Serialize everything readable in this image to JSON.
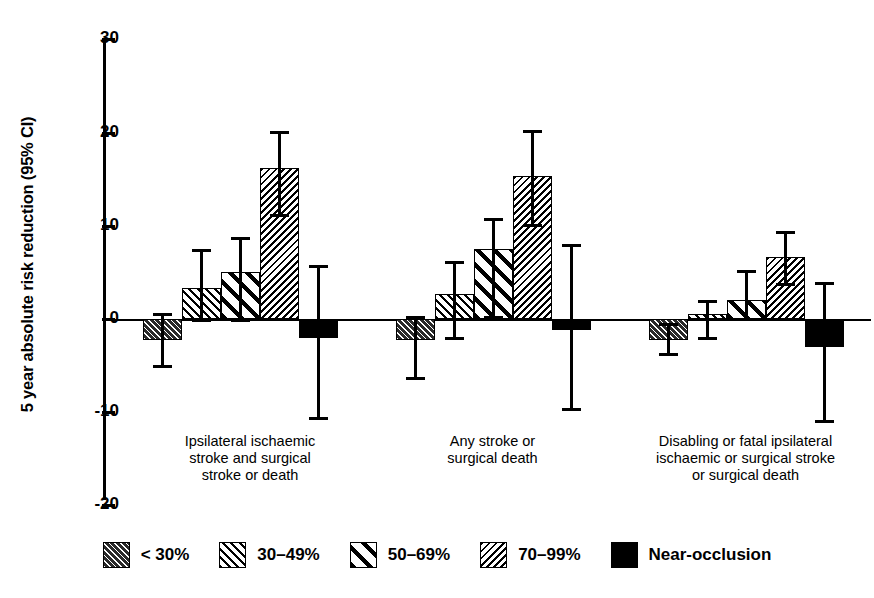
{
  "chart_data": {
    "type": "bar",
    "title": "",
    "xlabel": "",
    "ylabel": "5 year absolute risk reduction (95% CI)",
    "ylim": [
      -20,
      30
    ],
    "yticks": [
      30,
      20,
      10,
      0,
      -10,
      -20
    ],
    "grid": false,
    "legend_position": "bottom",
    "error_bars": "95% CI",
    "categories": [
      "Ipsilateral ischaemic\nstroke and surgical\nstroke or death",
      "Any  stroke or\nsurgical death",
      "Disabling or fatal ipsilateral\nischaemic or surgical stroke\nor surgical death"
    ],
    "series": [
      {
        "name": "< 30%",
        "pattern": "dense-hatch-45",
        "values": [
          -2.3,
          -2.3,
          -2.2
        ],
        "ci_low": [
          -5.3,
          -6.5,
          -4.0
        ],
        "ci_high": [
          0.6,
          0.3,
          -0.4
        ]
      },
      {
        "name": "30–49%",
        "pattern": "medium-hatch-45",
        "values": [
          3.3,
          2.7,
          0.5
        ],
        "ci_low": [
          -0.3,
          -2.3,
          -2.3
        ],
        "ci_high": [
          7.5,
          6.2,
          2.0
        ]
      },
      {
        "name": "50–69%",
        "pattern": "wide-hatch-45",
        "values": [
          5.0,
          7.5,
          2.0
        ],
        "ci_low": [
          -0.3,
          0.0,
          -0.2
        ],
        "ci_high": [
          8.8,
          10.8,
          5.3
        ]
      },
      {
        "name": "70–99%",
        "pattern": "fine-hatch-135",
        "values": [
          16.2,
          15.3,
          6.7
        ],
        "ci_low": [
          10.9,
          9.9,
          3.5
        ],
        "ci_high": [
          20.2,
          20.3,
          9.4
        ]
      },
      {
        "name": "Near-occlusion",
        "pattern": "solid-black",
        "values": [
          -2.0,
          -1.2,
          -3.0
        ],
        "ci_low": [
          -10.8,
          -9.9,
          -11.2
        ],
        "ci_high": [
          5.8,
          8.0,
          4.0
        ]
      }
    ]
  },
  "legend": {
    "items": [
      {
        "label": "< 30%"
      },
      {
        "label": "30–49%"
      },
      {
        "label": "50–69%"
      },
      {
        "label": "70–99%"
      },
      {
        "label": "Near-occlusion"
      }
    ]
  }
}
